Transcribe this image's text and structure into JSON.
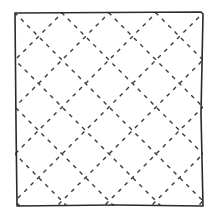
{
  "figure": {
    "title": "Square with diagonal dashed lattice",
    "colors": {
      "background": "#ffffff",
      "frame": "#2a2a2a",
      "lattice": "#3a3a3a"
    },
    "frame": {
      "x": 15,
      "y": 13,
      "size": 188
    },
    "lattice": {
      "divisions": 4,
      "dash": "4 5"
    }
  }
}
